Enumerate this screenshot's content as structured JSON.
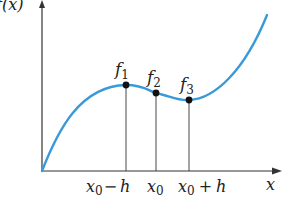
{
  "diagram": {
    "y_axis_label": "f(x)",
    "x_axis_label": "x",
    "curve_color": "#3a9ad9",
    "axis_color": "#333333",
    "points": [
      {
        "label": "f",
        "subscript": "1",
        "x_label": "x0 − h",
        "px": 126,
        "py": 85
      },
      {
        "label": "f",
        "subscript": "2",
        "x_label": "x0",
        "px": 156,
        "py": 93
      },
      {
        "label": "f",
        "subscript": "3",
        "x_label": "x0 + h",
        "px": 189,
        "py": 100
      }
    ],
    "tick_labels": {
      "left": {
        "base": "x",
        "sub": "0",
        "op": "−",
        "var": "h"
      },
      "center": {
        "base": "x",
        "sub": "0"
      },
      "right": {
        "base": "x",
        "sub": "0",
        "op": "+",
        "var": "h"
      }
    }
  }
}
